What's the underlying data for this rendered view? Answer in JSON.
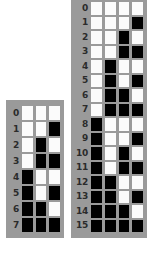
{
  "diagram": {
    "colors": {
      "panel_background": "#9a9a9a",
      "bit_one": "#000000",
      "bit_zero": "#fbfbfb",
      "label_text": "#2b2b2b",
      "page_background": "#ffffff"
    },
    "legend": {
      "bit_one_meaning": "1",
      "bit_zero_meaning": "0"
    },
    "tables": [
      {
        "name": "three-bit-table",
        "bit_width": 3,
        "row_count": 8,
        "rows": [
          {
            "label": "0",
            "bits": [
              0,
              0,
              0
            ]
          },
          {
            "label": "1",
            "bits": [
              0,
              0,
              1
            ]
          },
          {
            "label": "2",
            "bits": [
              0,
              1,
              0
            ]
          },
          {
            "label": "3",
            "bits": [
              0,
              1,
              1
            ]
          },
          {
            "label": "4",
            "bits": [
              1,
              0,
              0
            ]
          },
          {
            "label": "5",
            "bits": [
              1,
              0,
              1
            ]
          },
          {
            "label": "6",
            "bits": [
              1,
              1,
              0
            ]
          },
          {
            "label": "7",
            "bits": [
              1,
              1,
              1
            ]
          }
        ]
      },
      {
        "name": "four-bit-table",
        "bit_width": 4,
        "row_count": 16,
        "rows": [
          {
            "label": "0",
            "bits": [
              0,
              0,
              0,
              0
            ]
          },
          {
            "label": "1",
            "bits": [
              0,
              0,
              0,
              1
            ]
          },
          {
            "label": "2",
            "bits": [
              0,
              0,
              1,
              0
            ]
          },
          {
            "label": "3",
            "bits": [
              0,
              0,
              1,
              1
            ]
          },
          {
            "label": "4",
            "bits": [
              0,
              1,
              0,
              0
            ]
          },
          {
            "label": "5",
            "bits": [
              0,
              1,
              0,
              1
            ]
          },
          {
            "label": "6",
            "bits": [
              0,
              1,
              1,
              0
            ]
          },
          {
            "label": "7",
            "bits": [
              0,
              1,
              1,
              1
            ]
          },
          {
            "label": "8",
            "bits": [
              1,
              0,
              0,
              0
            ]
          },
          {
            "label": "9",
            "bits": [
              1,
              0,
              0,
              1
            ]
          },
          {
            "label": "10",
            "bits": [
              1,
              0,
              1,
              0
            ]
          },
          {
            "label": "11",
            "bits": [
              1,
              0,
              1,
              1
            ]
          },
          {
            "label": "12",
            "bits": [
              1,
              1,
              0,
              0
            ]
          },
          {
            "label": "13",
            "bits": [
              1,
              1,
              0,
              1
            ]
          },
          {
            "label": "14",
            "bits": [
              1,
              1,
              1,
              0
            ]
          },
          {
            "label": "15",
            "bits": [
              1,
              1,
              1,
              1
            ]
          }
        ]
      }
    ]
  }
}
